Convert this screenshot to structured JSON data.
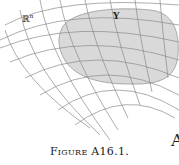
{
  "figure": {
    "space_label": "ℝ",
    "space_superscript": "n",
    "region_label": "Y",
    "corner_text": "A",
    "caption": "Figure A16.1."
  },
  "colors": {
    "grid_line": "#8a8a8a",
    "region_fill": "#d9d9d9",
    "region_stroke": "#999999",
    "text": "#222222"
  }
}
